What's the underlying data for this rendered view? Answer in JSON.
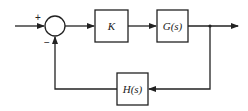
{
  "diagram": {
    "type": "feedback-control-block-diagram",
    "blocks": [
      {
        "id": "K",
        "label": "K"
      },
      {
        "id": "G",
        "label": "G(s)"
      },
      {
        "id": "H",
        "label": "H(s)"
      }
    ],
    "summing_junction": {
      "input_sign": "+",
      "feedback_sign": "−"
    },
    "colors": {
      "line": "#222222",
      "background": "#ffffff"
    }
  }
}
